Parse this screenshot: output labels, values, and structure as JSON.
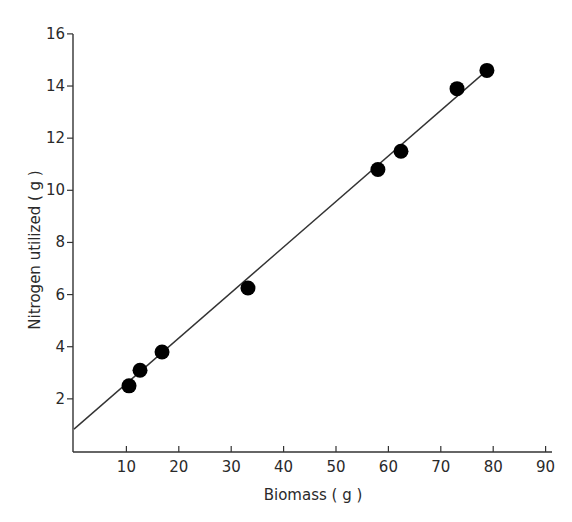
{
  "chart_data": {
    "type": "scatter",
    "title": "",
    "xlabel": "Biomass ( g )",
    "ylabel": "Nitrogen utilized ( g )",
    "xlim": [
      0,
      90
    ],
    "ylim": [
      0,
      16
    ],
    "x_ticks": [
      10,
      20,
      30,
      40,
      50,
      60,
      70,
      80,
      90
    ],
    "y_ticks": [
      2,
      4,
      6,
      8,
      10,
      12,
      14,
      16
    ],
    "grid": false,
    "legend": null,
    "series": [
      {
        "name": "observations",
        "marker": "filled-circle",
        "color": "#000000",
        "points": [
          {
            "x": 10.5,
            "y": 2.5
          },
          {
            "x": 12.6,
            "y": 3.1
          },
          {
            "x": 16.8,
            "y": 3.8
          },
          {
            "x": 33.2,
            "y": 6.25
          },
          {
            "x": 58.0,
            "y": 10.8
          },
          {
            "x": 62.4,
            "y": 11.5
          },
          {
            "x": 73.1,
            "y": 13.9
          },
          {
            "x": 78.8,
            "y": 14.6
          }
        ]
      }
    ],
    "fit_line": {
      "type": "linear",
      "color": "#333333",
      "start": {
        "x": 0,
        "y": 0.84
      },
      "end": {
        "x": 78.8,
        "y": 14.6
      }
    }
  }
}
